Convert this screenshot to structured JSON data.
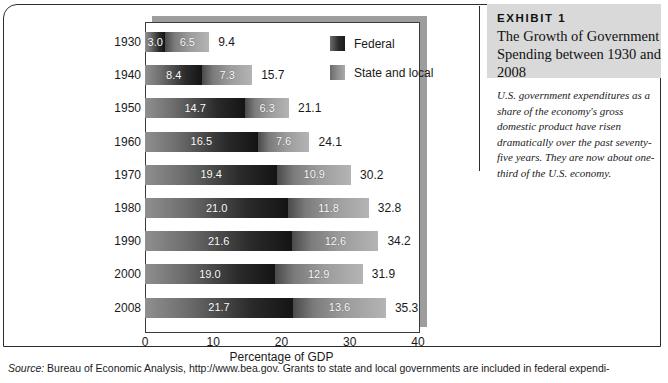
{
  "chart_data": {
    "type": "bar",
    "orientation": "horizontal",
    "stacked": true,
    "title": "The Growth of Government Spending between 1930 and 2008",
    "xlabel": "Percentage of GDP",
    "ylabel": "",
    "xlim": [
      0,
      40
    ],
    "xticks": [
      "0",
      "10",
      "20",
      "30",
      "40"
    ],
    "grid": false,
    "legend_position": "upper-right-inside",
    "categories": [
      "1930",
      "1940",
      "1950",
      "1960",
      "1970",
      "1980",
      "1990",
      "2000",
      "2008"
    ],
    "series": [
      {
        "name": "Federal",
        "color": "#2d2d2d",
        "values": [
          3.0,
          8.4,
          14.7,
          16.5,
          19.4,
          21.0,
          21.6,
          19.0,
          21.7
        ]
      },
      {
        "name": "State and local",
        "color": "#9b9b9b",
        "values": [
          6.5,
          7.3,
          6.3,
          7.6,
          10.9,
          11.8,
          12.6,
          12.9,
          13.6
        ]
      }
    ],
    "totals": [
      9.4,
      15.7,
      21.1,
      24.1,
      30.2,
      32.8,
      34.2,
      31.9,
      35.3
    ],
    "rows": [
      {
        "year": "1930",
        "federal": "3.0",
        "state": "6.5",
        "total": "9.4"
      },
      {
        "year": "1940",
        "federal": "8.4",
        "state": "7.3",
        "total": "15.7"
      },
      {
        "year": "1950",
        "federal": "14.7",
        "state": "6.3",
        "total": "21.1"
      },
      {
        "year": "1960",
        "federal": "16.5",
        "state": "7.6",
        "total": "24.1"
      },
      {
        "year": "1970",
        "federal": "19.4",
        "state": "10.9",
        "total": "30.2"
      },
      {
        "year": "1980",
        "federal": "21.0",
        "state": "11.8",
        "total": "32.8"
      },
      {
        "year": "1990",
        "federal": "21.6",
        "state": "12.6",
        "total": "34.2"
      },
      {
        "year": "2000",
        "federal": "19.0",
        "state": "12.9",
        "total": "31.9"
      },
      {
        "year": "2008",
        "federal": "21.7",
        "state": "13.6",
        "total": "35.3"
      }
    ]
  },
  "legend": {
    "items": [
      {
        "label": "Federal",
        "swatch": "federal-swatch"
      },
      {
        "label": "State and local",
        "swatch": "state-and-local-swatch"
      }
    ]
  },
  "axis": {
    "x_title": "Percentage of GDP",
    "x_ticks": [
      "0",
      "10",
      "20",
      "30",
      "40"
    ]
  },
  "exhibit": {
    "kicker": "EXHIBIT 1",
    "title": "The Growth of Government Spending between 1930 and 2008",
    "caption": "U.S. government expenditures as a share of the economy's gross domestic product have risen dramatically over the past seventy-five years. They are now about one-third of the U.S. economy."
  },
  "source": {
    "label": "Source:",
    "text": "Bureau of Economic Analysis, http://www.bea.gov. Grants to state and local governments are included in federal expendi-"
  },
  "colors": {
    "federal": "#2d2d2d",
    "state_and_local": "#9b9b9b",
    "exhibit_header_bg": "#d9d9d9",
    "frame": "#2c2c2c",
    "shadow": "#9d9d9d"
  }
}
